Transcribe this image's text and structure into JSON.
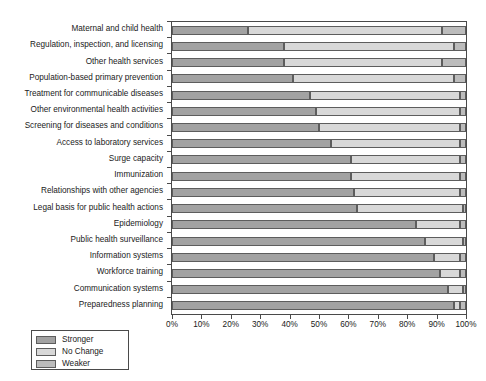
{
  "chart_data": {
    "type": "bar",
    "subtype": "stacked-horizontal-100-percent",
    "title": "",
    "xlabel": "",
    "ylabel": "",
    "xlim": [
      0,
      100
    ],
    "grid": false,
    "legend_position": "bottom-left",
    "axis_tick_labels": [
      "0%",
      "10%",
      "20%",
      "30%",
      "40%",
      "50%",
      "60%",
      "70%",
      "80%",
      "90%",
      "100%"
    ],
    "axis_tick_values": [
      0,
      10,
      20,
      30,
      40,
      50,
      60,
      70,
      80,
      90,
      100
    ],
    "categories": [
      "Maternal and child health",
      "Regulation, inspection, and licensing",
      "Other health services",
      "Population-based primary prevention",
      "Treatment for communicable diseases",
      "Other environmental health activities",
      "Screening for diseases and conditions",
      "Access to laboratory services",
      "Surge capacity",
      "Immunization",
      "Relationships with other agencies",
      "Legal basis for public health actions",
      "Epidemiology",
      "Public health surveillance",
      "Information systems",
      "Workforce training",
      "Communication systems",
      "Preparedness planning"
    ],
    "series": [
      {
        "name": "Stronger",
        "color": "#a2a2a2",
        "values": [
          26,
          38,
          38,
          41,
          47,
          49,
          50,
          54,
          61,
          61,
          62,
          63,
          83,
          86,
          89,
          91,
          94,
          96
        ]
      },
      {
        "name": "No Change",
        "color": "#d8d8d8",
        "values": [
          66,
          58,
          54,
          55,
          51,
          49,
          48,
          44,
          37,
          37,
          36,
          36,
          15,
          13,
          9,
          7,
          5,
          2
        ]
      },
      {
        "name": "Weaker",
        "color": "#bcbcbc",
        "values": [
          8,
          4,
          8,
          4,
          2,
          2,
          2,
          2,
          2,
          2,
          2,
          1,
          2,
          1,
          2,
          2,
          1,
          2
        ]
      }
    ]
  },
  "legend": {
    "items": [
      {
        "label": "Stronger",
        "color": "#a2a2a2"
      },
      {
        "label": "No Change",
        "color": "#d8d8d8"
      },
      {
        "label": "Weaker",
        "color": "#bcbcbc"
      }
    ]
  }
}
